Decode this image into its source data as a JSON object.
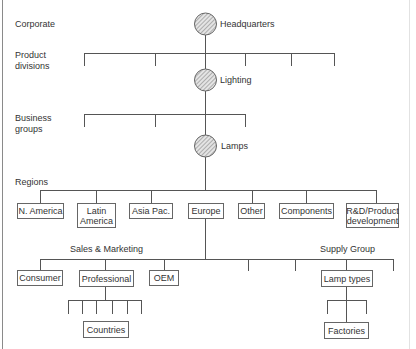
{
  "diagram": {
    "type": "organization-chart",
    "levels": {
      "corporate": "Corporate",
      "product_divisions": "Product\ndivisions",
      "business_groups": "Business\ngroups",
      "regions": "Regions"
    },
    "hierarchy_nodes": {
      "headquarters": "Headquarters",
      "lighting": "Lighting",
      "lamps": "Lamps"
    },
    "regions": [
      "N. America",
      "Latin\nAmerica",
      "Asia Pac.",
      "Europe",
      "Other",
      "Components",
      "R&D/Product\ndevelopment"
    ],
    "groups": {
      "sales_marketing": "Sales & Marketing",
      "supply_group": "Supply Group"
    },
    "sales_units": [
      "Consumer",
      "Professional",
      "OEM"
    ],
    "supply_units": [
      "Lamp types"
    ],
    "leaf_nodes": {
      "countries": "Countries",
      "factories": "Factories"
    },
    "colors": {
      "line": "#555555",
      "box_border": "#666666",
      "circle_fill": "#d6d6d6"
    }
  }
}
